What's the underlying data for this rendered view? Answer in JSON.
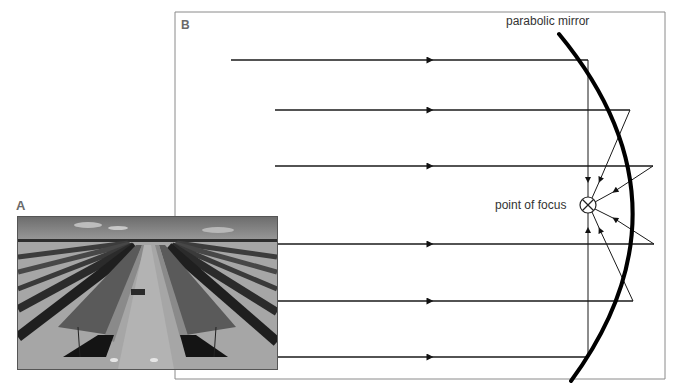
{
  "panels": {
    "a": {
      "label": "A",
      "image_description": "photograph of rows of parabolic trough solar collectors"
    },
    "b": {
      "label": "B"
    }
  },
  "labels": {
    "mirror": "parabolic mirror",
    "focus": "point of focus"
  },
  "colors": {
    "line": "#1a1a1a",
    "frame": "#8a8a8a",
    "label_text": "#333333"
  },
  "rays": [
    {
      "y": 60,
      "x_start": 231,
      "x_mirror": 588
    },
    {
      "y": 110,
      "x_start": 275,
      "x_mirror": 630
    },
    {
      "y": 166,
      "x_start": 275,
      "x_mirror": 653
    },
    {
      "y": 244,
      "x_start": 276,
      "x_mirror": 654
    },
    {
      "y": 301,
      "x_start": 276,
      "x_mirror": 633
    },
    {
      "y": 357,
      "x_start": 276,
      "x_mirror": 588
    }
  ],
  "focus_point": {
    "x": 588,
    "y": 205,
    "r": 8
  }
}
